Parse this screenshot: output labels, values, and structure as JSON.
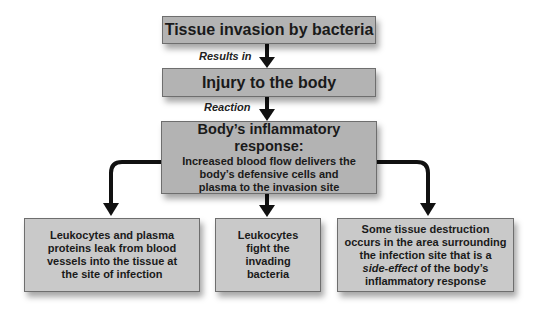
{
  "diagram": {
    "nodes": {
      "invasion": {
        "label": "Tissue invasion by bacteria"
      },
      "injury": {
        "label": "Injury to the body"
      },
      "inflammation": {
        "title": "Body’s inflammatory response:",
        "lines": [
          "Increased blood flow delivers the",
          "body’s defensive cells and",
          "plasma to the invasion site"
        ]
      },
      "leak": {
        "lines": [
          "Leukocytes and plasma",
          "proteins leak from blood",
          "vessels into the tissue at",
          "the site of infection"
        ]
      },
      "fight": {
        "lines": [
          "Leukocytes",
          "fight the",
          "invading",
          "bacteria"
        ]
      },
      "destruction": {
        "line1": "Some tissue destruction",
        "line2": "occurs in the area surrounding",
        "line3": "the infection site that is a",
        "line4_italic": "side-effect",
        "line4_rest": " of the body’s",
        "line5": "inflammatory response"
      }
    },
    "edges": {
      "invasion_to_injury": {
        "label": "Results in"
      },
      "injury_to_inflammation": {
        "label": "Reaction"
      }
    },
    "colors": {
      "box_dark": "#b3b3b3",
      "box_light": "#c9c9c9",
      "arrow": "#111111",
      "border": "#6e6e6e"
    }
  }
}
